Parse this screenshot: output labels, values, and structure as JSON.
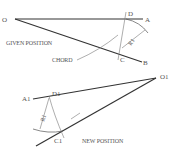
{
  "given": {
    "label_o": "O",
    "label_a": "A",
    "label_b": "B",
    "label_c": "C",
    "label_d": "D",
    "label_r": "R1",
    "caption": "GIVEN POSITION",
    "chord_label": "CHORD"
  },
  "new": {
    "label_o": "O1",
    "label_a": "A1",
    "label_c": "C1",
    "label_d": "D1",
    "label_r": "R1",
    "caption": "NEW POSITION"
  },
  "colors": {
    "line": "#333333",
    "thin": "#777777",
    "text": "#555555"
  }
}
